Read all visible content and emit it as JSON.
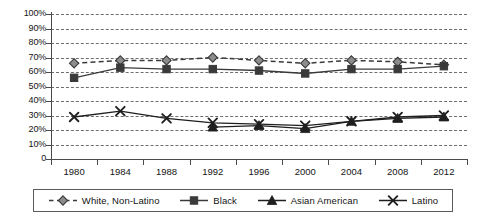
{
  "chart_data": {
    "type": "line",
    "title": "",
    "subtitle": "",
    "xlabel": "",
    "ylabel": "",
    "categories": [
      "1980",
      "1984",
      "1988",
      "1992",
      "1996",
      "2000",
      "2004",
      "2008",
      "2012"
    ],
    "ylim": [
      0,
      100
    ],
    "y_ticks": [
      "0",
      "10%",
      "20%",
      "30%",
      "40%",
      "50%",
      "60%",
      "70%",
      "80%",
      "90%",
      "100%"
    ],
    "y_tick_values": [
      0,
      10,
      20,
      30,
      40,
      50,
      60,
      70,
      80,
      90,
      100
    ],
    "grid": true,
    "legend_position": "bottom",
    "series": [
      {
        "name": "White, Non-Latino",
        "marker": "diamond",
        "line_style": "dashed",
        "color": "#3a3a3a",
        "marker_fill": "#8c8c8c",
        "values": [
          66,
          68,
          68,
          70,
          68,
          66,
          68,
          67,
          65
        ]
      },
      {
        "name": "Black",
        "marker": "square",
        "line_style": "solid",
        "color": "#3a3a3a",
        "marker_fill": "#3a3a3a",
        "values": [
          56,
          63,
          62,
          62,
          61,
          59,
          62,
          62,
          64
        ]
      },
      {
        "name": "Asian American",
        "marker": "triangle",
        "line_style": "solid",
        "color": "#1f1f1f",
        "marker_fill": "#1f1f1f",
        "values": [
          null,
          null,
          null,
          22,
          23,
          21,
          26,
          28,
          29
        ]
      },
      {
        "name": "Latino",
        "marker": "x",
        "line_style": "solid",
        "color": "#1f1f1f",
        "marker_fill": "#1f1f1f",
        "values": [
          29,
          33,
          28,
          25,
          24,
          23,
          26,
          29,
          30
        ]
      }
    ]
  },
  "legend": {
    "items": [
      {
        "label": "White, Non-Latino",
        "icon": "diamond-marker-icon"
      },
      {
        "label": "Black",
        "icon": "square-marker-icon"
      },
      {
        "label": "Asian American",
        "icon": "triangle-marker-icon"
      },
      {
        "label": "Latino",
        "icon": "x-marker-icon"
      }
    ]
  }
}
